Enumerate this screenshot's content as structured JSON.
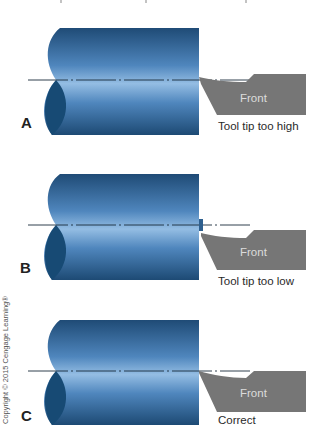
{
  "figure": {
    "top_text_fragment": "Fig … tool tip position relative to … centerline",
    "copyright": "Copyright © 2015 Cengage Learning®",
    "colors": {
      "cylinder_dark": "#1f4e7a",
      "cylinder_light": "#8fb8de",
      "cylinder_end_face": "#174a74",
      "tool_gray": "#767676",
      "centerline": "#1a2a3a"
    },
    "panels": [
      {
        "id": "A",
        "label": "A",
        "tool_label": "Front",
        "caption": "Tool tip too high"
      },
      {
        "id": "B",
        "label": "B",
        "tool_label": "Front",
        "caption": "Tool tip too low"
      },
      {
        "id": "C",
        "label": "C",
        "tool_label": "Front",
        "caption": "Correct"
      }
    ]
  }
}
